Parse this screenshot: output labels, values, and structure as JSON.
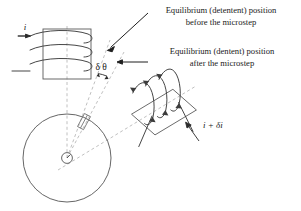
{
  "figure": {
    "background_color": "#ffffff",
    "line_color": "#2b2b2b",
    "dashed_color": "#b5b5b5",
    "text_color": "#1a1a1a"
  },
  "annotations": {
    "before_label_line1": "Equilibrium (detentent) position",
    "before_label_line2": "before the microstep",
    "after_label_line1": "Equilibrium (dentent) position",
    "after_label_line2": "after the microstep"
  },
  "symbols": {
    "current_in": "i",
    "angle": "δ θ",
    "current_out": "i + δi"
  },
  "geometry": {
    "rotor_center_x": 67,
    "rotor_center_y": 158,
    "rotor_radius": 44,
    "hub_radius": 5.5,
    "angle_delta_theta_deg": 12
  }
}
